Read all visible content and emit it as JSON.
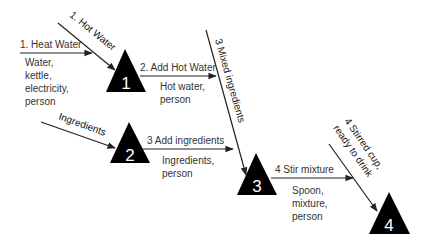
{
  "diagram": {
    "type": "activity-on-node process flow",
    "nodes": [
      {
        "id": "1",
        "label": "1"
      },
      {
        "id": "2",
        "label": "2"
      },
      {
        "id": "3",
        "label": "3"
      },
      {
        "id": "4",
        "label": "4"
      }
    ],
    "edges": [
      {
        "id": "heat-water",
        "label": "1. Heat Water",
        "resources": [
          "Water,",
          "kettle,",
          "electricity,",
          "person"
        ],
        "to": "1"
      },
      {
        "id": "hot-water-in",
        "label": "1. Hot Water",
        "to": "1"
      },
      {
        "id": "add-hot-water",
        "label": "2. Add Hot Water",
        "resources": [
          "Hot water,",
          "person"
        ],
        "from": "1"
      },
      {
        "id": "mixed-ingredients",
        "label": "3 Mixed ingredients",
        "to": "3"
      },
      {
        "id": "ingredients-in",
        "label": "Ingredients",
        "to": "2"
      },
      {
        "id": "add-ingredients",
        "label": "3 Add ingredients",
        "resources": [
          "Ingredients,",
          "person"
        ],
        "from": "2"
      },
      {
        "id": "stir-mixture",
        "label": "4 Stir mixture",
        "resources": [
          "Spoon,",
          "mixture,",
          "person"
        ],
        "from": "3"
      },
      {
        "id": "stirred-cup",
        "label": [
          "4 Stirred cup,",
          "ready to drink"
        ],
        "to": "4"
      }
    ]
  },
  "colors": {
    "node_fill": "#000000",
    "node_text": "#ffffff",
    "line": "#222222",
    "text": "#333333",
    "background": "#ffffff"
  }
}
